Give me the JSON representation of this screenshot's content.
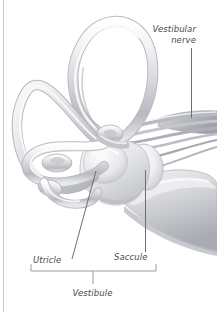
{
  "figure": {
    "background_color": "#ffffff",
    "border_color": "#c9c9cd",
    "line_color": "#6e6e72",
    "label_color": "#4a4a4a"
  },
  "labels": {
    "vestibular_nerve_line1": "Vestibular",
    "vestibular_nerve_line2": "nerve",
    "utricle": "Utricle",
    "saccule": "Saccule",
    "vestibule": "Vestibule"
  },
  "structures": [
    {
      "name": "superior-semicircular-canal",
      "tone": "#d9dade"
    },
    {
      "name": "posterior-semicircular-canal",
      "tone": "#d4d5d9"
    },
    {
      "name": "lateral-semicircular-canal",
      "tone": "#dcdde1"
    },
    {
      "name": "ampulla",
      "tone": "#cfd0d5"
    },
    {
      "name": "utricle",
      "tone": "#e2e3e7"
    },
    {
      "name": "saccule",
      "tone": "#eceded"
    },
    {
      "name": "vestibular-nerve-fibers",
      "tone": "#c4c5ca"
    },
    {
      "name": "cochlea",
      "tone": "#d3d4d8"
    }
  ],
  "annotations": {
    "bracket": {
      "name": "vestibule-bracket",
      "span_label": "Vestibule"
    },
    "leaders": [
      {
        "name": "vestibular-nerve-leader",
        "orientation": "vertical"
      },
      {
        "name": "saccule-leader",
        "orientation": "vertical"
      },
      {
        "name": "utricle-leader",
        "orientation": "diagonal"
      }
    ]
  }
}
